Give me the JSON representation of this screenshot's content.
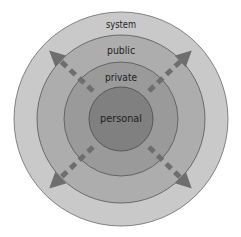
{
  "diagram": {
    "type": "concentric-circles",
    "center": {
      "x": 121,
      "y": 119
    },
    "rings": [
      {
        "id": "system",
        "label": "system",
        "radius": 107,
        "fill": "#c9c9c9",
        "label_y": 25
      },
      {
        "id": "public",
        "label": "public",
        "radius": 84,
        "fill": "#adadad",
        "label_y": 51
      },
      {
        "id": "private",
        "label": "private",
        "radius": 57,
        "fill": "#9a9a9a",
        "label_y": 78
      },
      {
        "id": "personal",
        "label": "personal",
        "radius": 32,
        "fill": "#808080",
        "label_y": 119
      }
    ],
    "ring_stroke": "#5a5a5a",
    "arrows": {
      "color": "#6e6e6e",
      "style": "dashed",
      "directions": [
        "top-left",
        "top-right",
        "bottom-left",
        "bottom-right"
      ]
    }
  },
  "labels": {
    "system": "system",
    "public": "public",
    "private": "private",
    "personal": "personal"
  }
}
